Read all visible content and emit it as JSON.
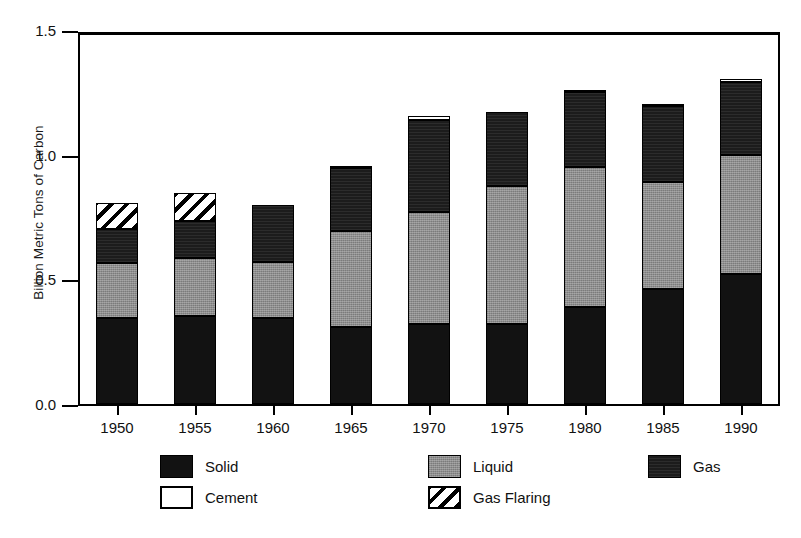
{
  "chart_data": {
    "type": "bar",
    "stacked": true,
    "title": "",
    "xlabel": "",
    "ylabel": "Billion Metric Tons of Carbon",
    "categories": [
      "1950",
      "1955",
      "1960",
      "1965",
      "1970",
      "1975",
      "1980",
      "1985",
      "1990"
    ],
    "ylim": [
      0.0,
      1.5
    ],
    "yticks": [
      0.0,
      0.5,
      1.0,
      1.5
    ],
    "ytick_labels": [
      "0.0",
      "0.5",
      "1.0",
      "1.5"
    ],
    "grid": false,
    "legend_position": "bottom",
    "series": [
      {
        "name": "Solid",
        "color": "#121212",
        "values": [
          0.345,
          0.355,
          0.345,
          0.31,
          0.32,
          0.32,
          0.39,
          0.46,
          0.52
        ]
      },
      {
        "name": "Liquid",
        "color": "#8d8d8d",
        "values": [
          0.22,
          0.23,
          0.225,
          0.385,
          0.45,
          0.555,
          0.56,
          0.43,
          0.48
        ]
      },
      {
        "name": "Gas",
        "color": "#1c1c1c",
        "values": [
          0.135,
          0.15,
          0.23,
          0.25,
          0.37,
          0.295,
          0.3,
          0.305,
          0.29
        ]
      },
      {
        "name": "Cement",
        "color": "#ffffff",
        "values": [
          0.0,
          0.0,
          0.0,
          0.01,
          0.015,
          0.0,
          0.01,
          0.01,
          0.015
        ]
      },
      {
        "name": "Gas Flaring",
        "color": "#ffffff",
        "values": [
          0.105,
          0.11,
          0.0,
          0.0,
          0.0,
          0.0,
          0.0,
          0.0,
          0.0
        ]
      }
    ],
    "totals": [
      0.805,
      0.845,
      0.8,
      0.955,
      1.155,
      1.17,
      1.26,
      1.205,
      1.305
    ]
  },
  "legend": {
    "entries": [
      {
        "label": "Solid",
        "swatch": "solid"
      },
      {
        "label": "Liquid",
        "swatch": "liquid"
      },
      {
        "label": "Gas",
        "swatch": "gas"
      },
      {
        "label": "Cement",
        "swatch": "cement"
      },
      {
        "label": "Gas Flaring",
        "swatch": "flaring"
      }
    ]
  }
}
